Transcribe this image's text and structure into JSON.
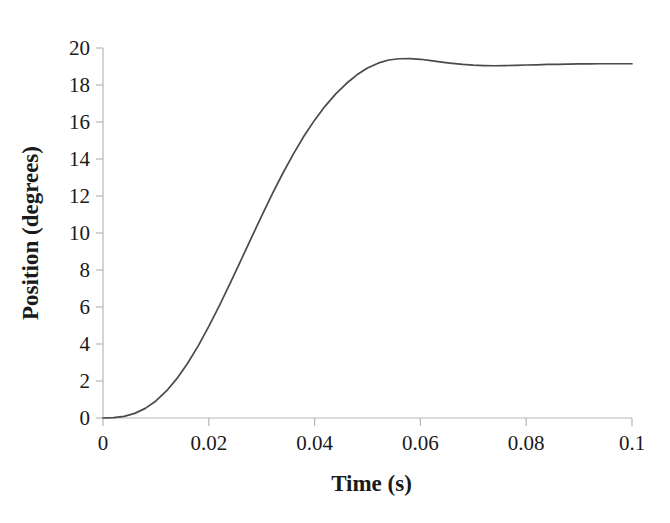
{
  "chart_data": {
    "type": "line",
    "title": "",
    "subtitle": "",
    "xlabel": "Time (s)",
    "ylabel": "Position (degrees)",
    "xlim": [
      0,
      0.1
    ],
    "ylim": [
      0,
      20
    ],
    "xticks": [
      "0",
      "0.02",
      "0.04",
      "0.06",
      "0.08",
      "0.1"
    ],
    "xtick_values": [
      0,
      0.02,
      0.04,
      0.06,
      0.08,
      0.1
    ],
    "yticks": [
      "0",
      "2",
      "4",
      "6",
      "8",
      "10",
      "12",
      "14",
      "16",
      "18",
      "20"
    ],
    "ytick_values": [
      0,
      2,
      4,
      6,
      8,
      10,
      12,
      14,
      16,
      18,
      20
    ],
    "grid": false,
    "legend": false,
    "legend_position": "none",
    "series": [
      {
        "name": "Position response",
        "color": "#4a4a4a",
        "line_width": 1.7,
        "x": [
          0,
          0.002,
          0.004,
          0.006,
          0.008,
          0.01,
          0.012,
          0.014,
          0.016,
          0.018,
          0.02,
          0.022,
          0.024,
          0.026,
          0.028,
          0.03,
          0.032,
          0.034,
          0.036,
          0.038,
          0.04,
          0.042,
          0.044,
          0.046,
          0.048,
          0.05,
          0.052,
          0.054,
          0.056,
          0.058,
          0.06,
          0.062,
          0.064,
          0.066,
          0.068,
          0.07,
          0.072,
          0.074,
          0.076,
          0.078,
          0.08,
          0.082,
          0.084,
          0.086,
          0.088,
          0.09,
          0.092,
          0.094,
          0.096,
          0.098,
          0.1
        ],
        "y": [
          0.0,
          0.02,
          0.09,
          0.25,
          0.52,
          0.92,
          1.46,
          2.14,
          2.96,
          3.9,
          4.95,
          6.08,
          7.26,
          8.48,
          9.71,
          10.93,
          12.11,
          13.23,
          14.28,
          15.24,
          16.1,
          16.86,
          17.52,
          18.08,
          18.55,
          18.92,
          19.18,
          19.35,
          19.42,
          19.43,
          19.39,
          19.32,
          19.24,
          19.17,
          19.11,
          19.07,
          19.05,
          19.04,
          19.05,
          19.06,
          19.08,
          19.09,
          19.11,
          19.12,
          19.13,
          19.14,
          19.14,
          19.15,
          19.15,
          19.15,
          19.15
        ]
      }
    ],
    "annotations": [],
    "notes": {
      "steady_state": 19.15,
      "overshoot_peak": 19.43,
      "overshoot_time": 0.058,
      "background_color": "#ffffff",
      "axis_color": "#b8b8b8",
      "text_color": "#1a1a1a"
    }
  }
}
